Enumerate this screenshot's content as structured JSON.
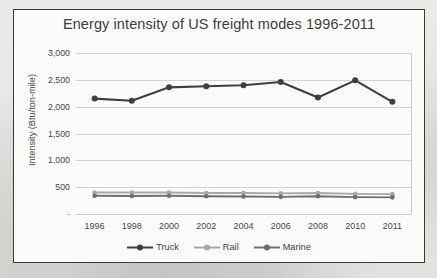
{
  "figure": {
    "background_color": "#fbfbfa",
    "border_color": "#3a3a3a"
  },
  "chart_data": {
    "type": "line",
    "title": "Energy intensity of US freight modes 1996-2011",
    "xlabel": "",
    "ylabel": "Intensity (Btu/ton-mile)",
    "categories": [
      "1996",
      "1998",
      "2000",
      "2002",
      "2004",
      "2006",
      "2008",
      "2010",
      "2011"
    ],
    "ylim": [
      0,
      3000
    ],
    "ytick_labels": [
      "-",
      "500",
      "1,000",
      "1,500",
      "2,000",
      "2,500",
      "3,000"
    ],
    "ytick_values": [
      0,
      500,
      1000,
      1500,
      2000,
      2500,
      3000
    ],
    "grid": true,
    "legend_position": "bottom",
    "series": [
      {
        "name": "Truck",
        "color": "#3f3f3f",
        "marker": "circle",
        "values": [
          2150,
          2110,
          2360,
          2380,
          2400,
          2460,
          2170,
          2490,
          2090
        ]
      },
      {
        "name": "Rail",
        "color": "#a8a8a8",
        "marker": "circle",
        "values": [
          400,
          400,
          400,
          390,
          390,
          385,
          390,
          375,
          370
        ]
      },
      {
        "name": "Marine",
        "color": "#6e6e6e",
        "marker": "circle",
        "values": [
          340,
          335,
          340,
          330,
          325,
          320,
          330,
          315,
          310
        ]
      }
    ]
  }
}
